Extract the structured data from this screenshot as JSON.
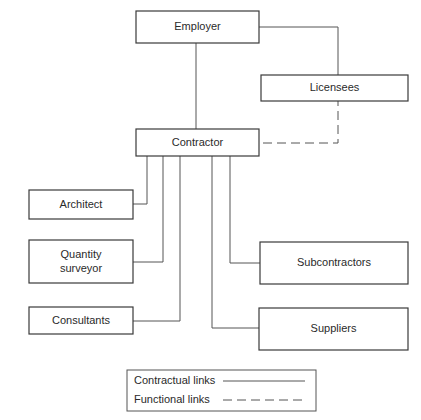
{
  "diagram": {
    "nodes": {
      "employer": "Employer",
      "licensees": "Licensees",
      "contractor": "Contractor",
      "architect": "Architect",
      "quantity_surveyor_line1": "Quantity",
      "quantity_surveyor_line2": "surveyor",
      "consultants": "Consultants",
      "subcontractors": "Subcontractors",
      "suppliers": "Suppliers"
    },
    "edges": [
      {
        "from": "Employer",
        "to": "Contractor",
        "type": "contractual"
      },
      {
        "from": "Employer",
        "to": "Licensees",
        "type": "contractual"
      },
      {
        "from": "Contractor",
        "to": "Licensees",
        "type": "functional"
      },
      {
        "from": "Contractor",
        "to": "Architect",
        "type": "contractual"
      },
      {
        "from": "Contractor",
        "to": "Quantity surveyor",
        "type": "contractual"
      },
      {
        "from": "Contractor",
        "to": "Consultants",
        "type": "contractual"
      },
      {
        "from": "Contractor",
        "to": "Subcontractors",
        "type": "contractual"
      },
      {
        "from": "Contractor",
        "to": "Suppliers",
        "type": "contractual"
      }
    ],
    "legend": {
      "contractual": "Contractual links",
      "functional": "Functional links"
    }
  }
}
